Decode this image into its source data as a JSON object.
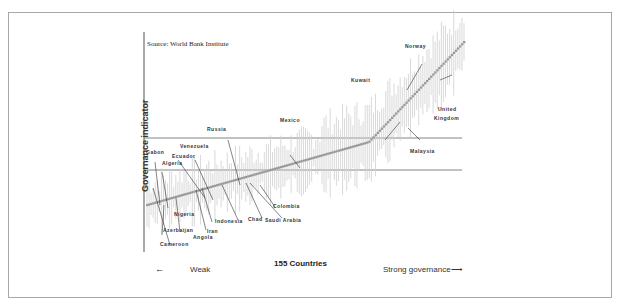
{
  "chart_data": {
    "type": "scatter",
    "title": "",
    "source_note": "Source: World Bank Institute",
    "xlabel": "155 Countries",
    "ylabel": "Governance indicator",
    "x_direction_left": "Weak",
    "x_direction_right": "Strong governance",
    "n_countries": 155,
    "series": [
      {
        "name": "Governance estimate (ranked) with confidence intervals",
        "color": "#9a9a9a"
      }
    ],
    "reference_lines": [
      {
        "name": "upper threshold",
        "orientation": "horizontal"
      },
      {
        "name": "lower threshold",
        "orientation": "horizontal"
      }
    ],
    "annotations": [
      "Gabon",
      "Algeria",
      "Ecuador",
      "Venezuela",
      "Russia",
      "Mexico",
      "Kuwait",
      "Norway",
      "United Kingdom",
      "Malaysia",
      "Colombia",
      "Saudi Arabia",
      "Chad",
      "Indonesia",
      "Iran",
      "Angola",
      "Nigeria",
      "Azerbaijan",
      "Cameroon"
    ],
    "grid": false,
    "legend": "none"
  },
  "labels": {
    "source": "Source: World Bank Institute",
    "ylabel": "Governance indicator",
    "xlabel": "155 Countries",
    "weak": "Weak",
    "weak_arrow": "←",
    "strong": "Strong governance⟶",
    "countries": {
      "gabon": "Gabon",
      "algeria": "Algeria",
      "ecuador": "Ecuador",
      "venezuela": "Venezuela",
      "russia": "Russia",
      "mexico": "Mexico",
      "kuwait": "Kuwait",
      "norway": "Norway",
      "uk1": "United",
      "uk2": "Kingdom",
      "malaysia": "Malaysia",
      "colombia": "Colombia",
      "saudi": "Saudi Arabia",
      "chad": "Chad",
      "indonesia": "Indonesia",
      "iran": "Iran",
      "angola": "Angola",
      "nigeria": "Nigeria",
      "azerbaijan": "Azerbaijan",
      "cameroon": "Cameroon"
    }
  }
}
